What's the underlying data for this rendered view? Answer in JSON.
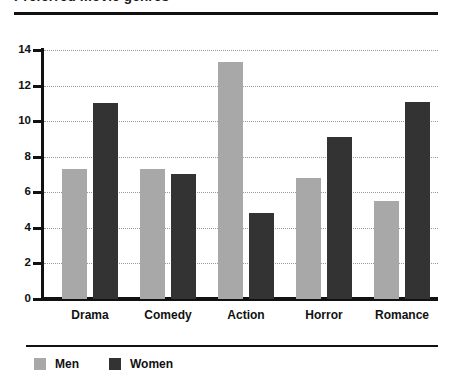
{
  "chart_data": {
    "type": "bar",
    "title": "Preferred movie genres",
    "xlabel": "",
    "ylabel": "",
    "ylim": [
      0,
      14
    ],
    "yticks": [
      "0",
      "2",
      "4",
      "6",
      "8",
      "10",
      "12",
      "14"
    ],
    "grid": true,
    "legend_position": "bottom-left",
    "categories": [
      "Drama",
      "Comedy",
      "Action",
      "Horror",
      "Romance"
    ],
    "series": [
      {
        "name": "Men",
        "color": "#a8a8a8",
        "values": [
          7.3,
          7.3,
          13.3,
          6.8,
          5.5
        ]
      },
      {
        "name": "Women",
        "color": "#333333",
        "values": [
          11.0,
          7.05,
          4.85,
          9.1,
          11.1
        ]
      }
    ]
  }
}
